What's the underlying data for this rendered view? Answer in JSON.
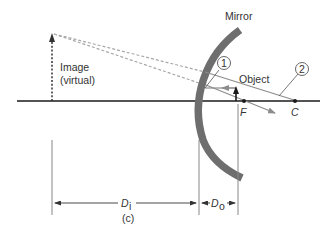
{
  "figure": {
    "panel_label": "(c)",
    "labels": {
      "mirror": "Mirror",
      "image_line1": "Image",
      "image_line2": "(virtual)",
      "object": "Object",
      "focal_point": "F",
      "center_of_curvature": "C",
      "ray_1": "1",
      "ray_2": "2",
      "image_distance": "D",
      "image_distance_sub": "i",
      "object_distance": "D",
      "object_distance_sub": "o"
    },
    "colors": {
      "mirror": "#6e6e6e",
      "axis": "#1a1a1a",
      "rays": "#8c8c8c",
      "dashed_rays": "#a0a0a0",
      "text": "#333333"
    }
  }
}
